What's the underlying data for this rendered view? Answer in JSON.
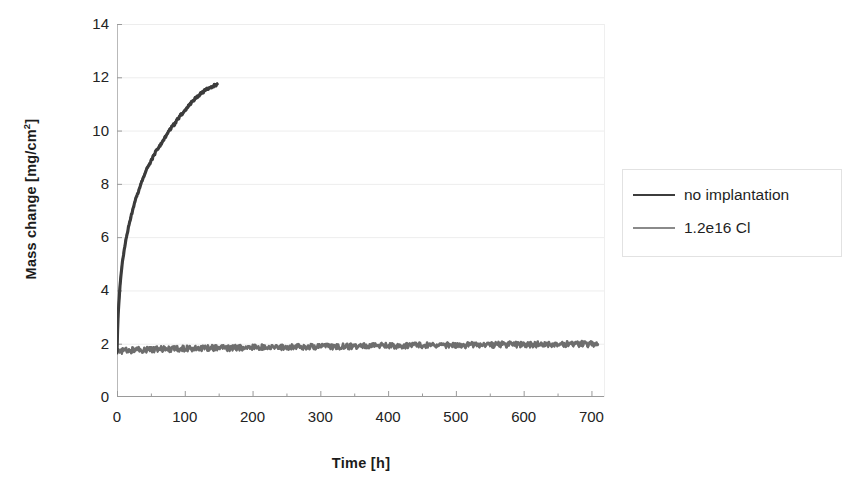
{
  "chart_data": {
    "type": "line",
    "title": "",
    "xlabel": "Time [h]",
    "ylabel": "Mass change [mg/cm²]",
    "ylabel_html": "Mass change [mg/cm<sup>2</sup>]",
    "xlim": [
      0,
      720
    ],
    "ylim": [
      0,
      14
    ],
    "xticks": [
      0,
      100,
      200,
      300,
      400,
      500,
      600,
      700
    ],
    "xticklabels": [
      "0",
      "100",
      "200",
      "300",
      "400",
      "500",
      "600",
      "700"
    ],
    "xminor_step": 50,
    "yticks": [
      0,
      2,
      4,
      6,
      8,
      10,
      12,
      14
    ],
    "yticklabels": [
      "0",
      "2",
      "4",
      "6",
      "8",
      "10",
      "12",
      "14"
    ],
    "grid": "horizontal",
    "grid_color": "#ededed",
    "legend_position": "right-outside",
    "series": [
      {
        "name": "no implantation",
        "color": "#3c3c3c",
        "x": [
          0,
          1,
          2,
          4,
          6,
          8,
          10,
          13,
          16,
          20,
          25,
          30,
          35,
          40,
          45,
          50,
          55,
          60,
          65,
          70,
          75,
          80,
          85,
          90,
          95,
          100,
          105,
          110,
          115,
          120,
          125,
          130,
          135,
          140,
          145,
          148
        ],
        "values": [
          1.7,
          2.6,
          3.2,
          4.0,
          4.6,
          5.05,
          5.4,
          5.85,
          6.25,
          6.7,
          7.2,
          7.6,
          7.95,
          8.3,
          8.6,
          8.85,
          9.1,
          9.3,
          9.5,
          9.7,
          9.9,
          10.1,
          10.25,
          10.45,
          10.6,
          10.75,
          10.9,
          11.05,
          11.2,
          11.3,
          11.4,
          11.5,
          11.58,
          11.65,
          11.7,
          11.72
        ]
      },
      {
        "name": "1.2e16 Cl",
        "color": "#6e6e6e",
        "x": [
          0,
          30,
          60,
          90,
          120,
          150,
          180,
          210,
          240,
          270,
          300,
          330,
          360,
          390,
          420,
          450,
          480,
          510,
          540,
          570,
          600,
          630,
          660,
          690,
          710
        ],
        "values": [
          1.72,
          1.78,
          1.8,
          1.82,
          1.84,
          1.85,
          1.86,
          1.88,
          1.89,
          1.9,
          1.9,
          1.91,
          1.92,
          1.93,
          1.94,
          1.95,
          1.95,
          1.96,
          1.97,
          1.98,
          1.98,
          1.99,
          2.0,
          2.0,
          2.0
        ],
        "noise_amplitude": 0.1
      }
    ]
  },
  "legend": {
    "items": [
      {
        "label": "no implantation",
        "color": "#3c3c3c"
      },
      {
        "label": "1.2e16 Cl",
        "color": "#8a8a8a"
      }
    ]
  },
  "axes": {
    "x_title": "Time [h]",
    "y_title_text": "Mass change [mg/cm2]"
  }
}
